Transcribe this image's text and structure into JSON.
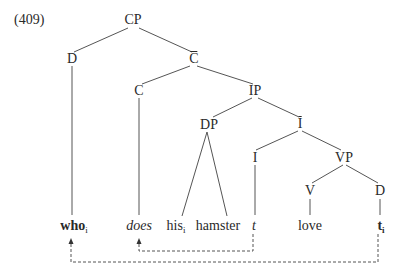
{
  "example_number": "(409)",
  "tree": {
    "nodes": {
      "cp": "CP",
      "d_spec": "D",
      "c_bar": "C",
      "c_head": "C",
      "ip": "IP",
      "dp": "DP",
      "i_bar": "I",
      "i_head": "I",
      "vp": "VP",
      "v": "V",
      "d_obj": "D"
    },
    "leaves": {
      "who": "who",
      "who_index": "i",
      "does": "does",
      "his": "his",
      "his_index": "i",
      "hamster": "hamster",
      "t": "t",
      "love": "love",
      "trace": "t",
      "trace_index": "i"
    },
    "movement_arrows": [
      {
        "from": "t_i",
        "to": "who",
        "style": "dashed"
      },
      {
        "from": "t",
        "to": "does",
        "style": "dashed"
      }
    ]
  }
}
